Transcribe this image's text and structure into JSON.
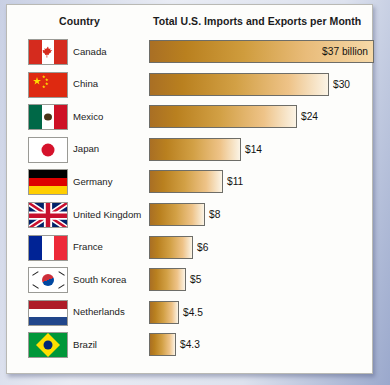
{
  "header": {
    "country_label": "Country",
    "chart_title": "Total U.S. Imports and Exports per Month"
  },
  "chart_data": {
    "type": "bar",
    "orientation": "horizontal",
    "title": "Total U.S. Imports and Exports per Month",
    "xlabel": "",
    "ylabel": "Country",
    "units": "billions of U.S. dollars per month",
    "categories": [
      "Canada",
      "China",
      "Mexico",
      "Japan",
      "Germany",
      "United Kingdom",
      "France",
      "South Korea",
      "Netherlands",
      "Brazil"
    ],
    "values": [
      37,
      30,
      24,
      14,
      11,
      8,
      6,
      5,
      4.5,
      4.3
    ],
    "value_labels": [
      "$37 billion",
      "$30",
      "$24",
      "$14",
      "$11",
      "$8",
      "$6",
      "$5",
      "$4.5",
      "$4.3"
    ],
    "xlim": [
      0,
      40
    ],
    "grid": false,
    "legend": null,
    "bar_gradient": {
      "start": "#a96f24",
      "end": "#fbf4e6"
    }
  },
  "rows": [
    {
      "country": "Canada",
      "value_label": "$37 billion",
      "label_position": "inside",
      "bar_width_px": 225
    },
    {
      "country": "China",
      "value_label": "$30",
      "label_position": "outside",
      "bar_width_px": 180
    },
    {
      "country": "Mexico",
      "value_label": "$24",
      "label_position": "outside",
      "bar_width_px": 148
    },
    {
      "country": "Japan",
      "value_label": "$14",
      "label_position": "outside",
      "bar_width_px": 92
    },
    {
      "country": "Germany",
      "value_label": "$11",
      "label_position": "outside",
      "bar_width_px": 74
    },
    {
      "country": "United Kingdom",
      "value_label": "$8",
      "label_position": "outside",
      "bar_width_px": 56
    },
    {
      "country": "France",
      "value_label": "$6",
      "label_position": "outside",
      "bar_width_px": 44
    },
    {
      "country": "South Korea",
      "value_label": "$5",
      "label_position": "outside",
      "bar_width_px": 37
    },
    {
      "country": "Netherlands",
      "value_label": "$4.5",
      "label_position": "outside",
      "bar_width_px": 30
    },
    {
      "country": "Brazil",
      "value_label": "$4.3",
      "label_position": "outside",
      "bar_width_px": 27
    }
  ],
  "colors": {
    "card_background": "#fdfdfb",
    "page_background": "#8e9cc4",
    "bar_border": "#6d6d68",
    "text": "#1c1c1c"
  }
}
